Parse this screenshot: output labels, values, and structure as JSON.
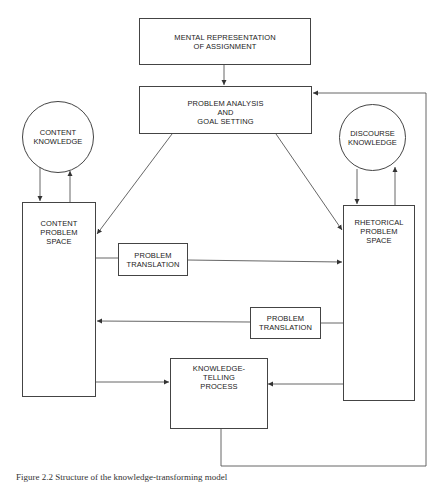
{
  "diagram": {
    "nodes": {
      "mental_representation": {
        "lines": [
          "MENTAL REPRESENTATION",
          "OF ASSIGNMENT"
        ]
      },
      "problem_analysis": {
        "lines": [
          "PROBLEM ANALYSIS",
          "AND",
          "GOAL SETTING"
        ]
      },
      "content_knowledge": {
        "lines": [
          "CONTENT",
          "KNOWLEDGE"
        ]
      },
      "discourse_knowledge": {
        "lines": [
          "DISCOURSE",
          "KNOWLEDGE"
        ]
      },
      "content_problem_space": {
        "lines": [
          "CONTENT",
          "PROBLEM",
          "SPACE"
        ]
      },
      "rhetorical_problem_space": {
        "lines": [
          "RHETORICAL",
          "PROBLEM",
          "SPACE"
        ]
      },
      "translation_content_to_rhetorical": {
        "lines": [
          "PROBLEM",
          "TRANSLATION"
        ]
      },
      "translation_rhetorical_to_content": {
        "lines": [
          "PROBLEM",
          "TRANSLATION"
        ]
      },
      "knowledge_telling": {
        "lines": [
          "KNOWLEDGE-",
          "TELLING",
          "PROCESS"
        ]
      }
    },
    "edges": [
      {
        "from": "MENTAL REPRESENTATION OF ASSIGNMENT",
        "to": "PROBLEM ANALYSIS AND GOAL SETTING"
      },
      {
        "from": "PROBLEM ANALYSIS AND GOAL SETTING",
        "to": "CONTENT PROBLEM SPACE"
      },
      {
        "from": "PROBLEM ANALYSIS AND GOAL SETTING",
        "to": "RHETORICAL PROBLEM SPACE"
      },
      {
        "from": "CONTENT KNOWLEDGE",
        "to": "CONTENT PROBLEM SPACE"
      },
      {
        "from": "CONTENT PROBLEM SPACE",
        "to": "CONTENT KNOWLEDGE"
      },
      {
        "from": "DISCOURSE KNOWLEDGE",
        "to": "RHETORICAL PROBLEM SPACE"
      },
      {
        "from": "RHETORICAL PROBLEM SPACE",
        "to": "DISCOURSE KNOWLEDGE"
      },
      {
        "from": "CONTENT PROBLEM SPACE",
        "to": "RHETORICAL PROBLEM SPACE",
        "via": "PROBLEM TRANSLATION"
      },
      {
        "from": "RHETORICAL PROBLEM SPACE",
        "to": "CONTENT PROBLEM SPACE",
        "via": "PROBLEM TRANSLATION"
      },
      {
        "from": "CONTENT PROBLEM SPACE",
        "to": "KNOWLEDGE-TELLING PROCESS"
      },
      {
        "from": "RHETORICAL PROBLEM SPACE",
        "to": "KNOWLEDGE-TELLING PROCESS"
      },
      {
        "from": "KNOWLEDGE-TELLING PROCESS",
        "to": "PROBLEM ANALYSIS AND GOAL SETTING"
      }
    ],
    "caption": "Figure 2.2  Structure of the knowledge-transforming model"
  },
  "colors": {
    "line": "#444444",
    "text": "#222222",
    "background": "#ffffff"
  }
}
